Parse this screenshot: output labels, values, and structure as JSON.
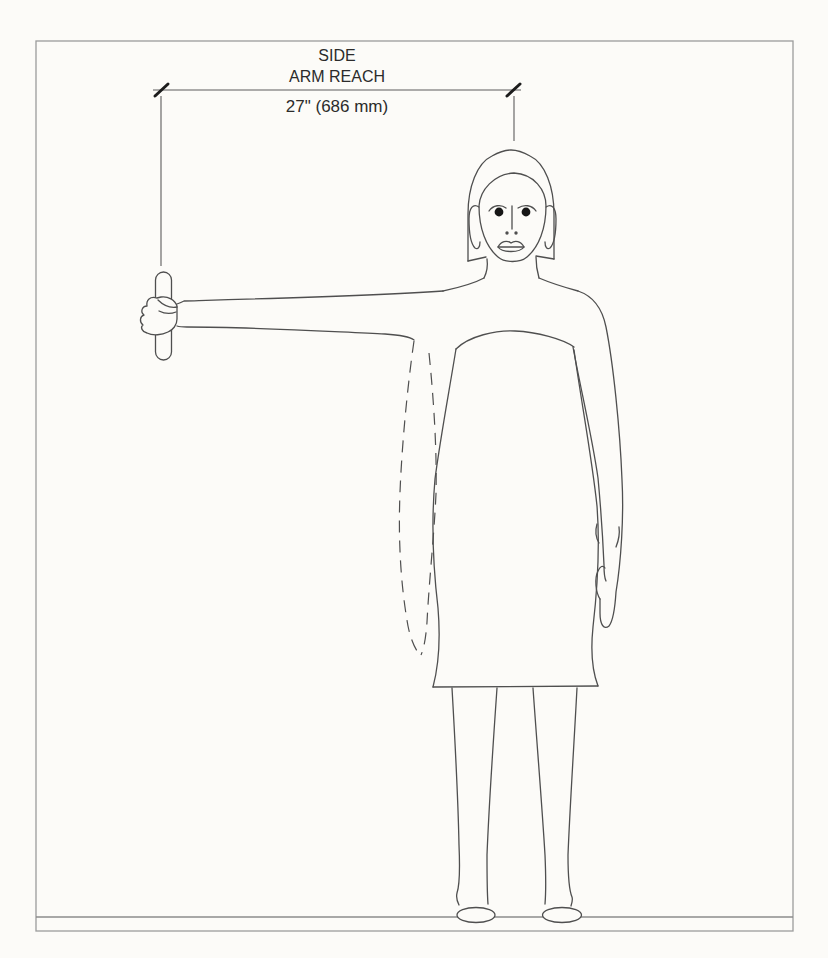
{
  "colors": {
    "paper": "#fcfbf8",
    "ink": "#2b2b2b",
    "frame": "#9b9b9b",
    "ground": "#8c8c8c",
    "figure": "#4f4f4f",
    "dimension": "#5c5c5c",
    "tick": "#1c1c1c",
    "eye": "#161616"
  },
  "dimension": {
    "label_top": "SIDE",
    "label_bottom": "ARM REACH",
    "value": "27\" (686 mm)",
    "value_inches": 27,
    "value_mm": 686
  }
}
